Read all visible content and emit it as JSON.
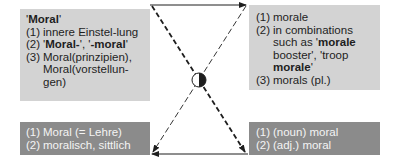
{
  "top_left": {
    "title": "Moral",
    "items": [
      {
        "num": "(1)",
        "text": "innere Einstel-lung"
      },
      {
        "num": "(2)",
        "parts": [
          "'",
          "Moral-",
          "', '",
          "-moral",
          "'"
        ]
      },
      {
        "num": "(3)",
        "text": "Moral(prinzipien), Moral(vorstellun-gen)"
      }
    ]
  },
  "top_right": {
    "items": [
      {
        "num": "(1)",
        "text": "morale"
      },
      {
        "num": "(2)",
        "parts": [
          "in combinations such as '",
          "morale",
          " booster', 'troop ",
          "morale",
          "'"
        ]
      },
      {
        "num": "(3)",
        "text": "morals (pl.)"
      }
    ]
  },
  "bottom_left": {
    "items": [
      {
        "num": "(1)",
        "text": "Moral (= Lehre)"
      },
      {
        "num": "(2)",
        "text": "moralisch, sittlich"
      }
    ]
  },
  "bottom_right": {
    "items": [
      {
        "num": "(1)",
        "text": "(noun) moral"
      },
      {
        "num": "(2)",
        "text": "(adj.) moral"
      }
    ]
  },
  "colors": {
    "light_box": "#d3d3d3",
    "dark_box": "#8b8b8b",
    "line": "#1e1e1e"
  }
}
